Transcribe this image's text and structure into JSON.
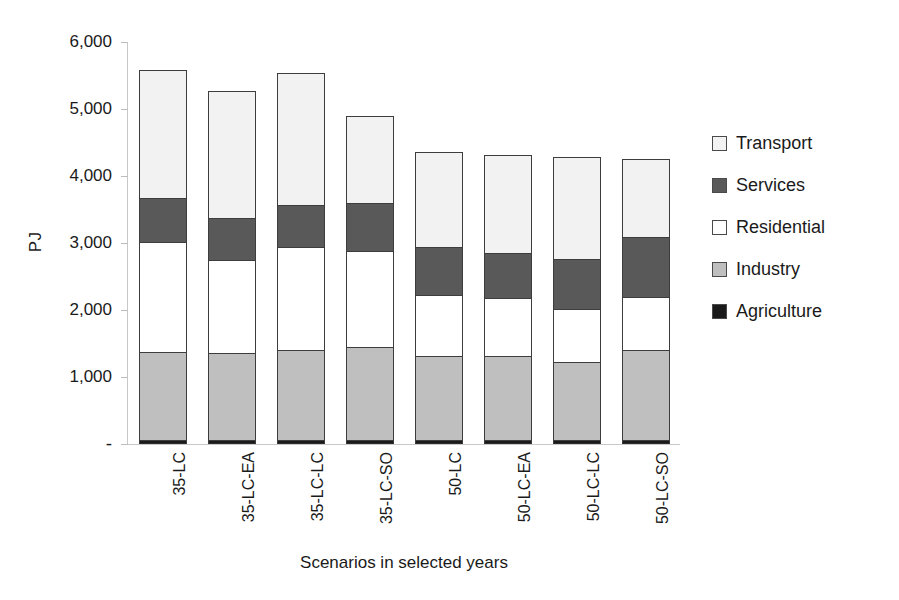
{
  "chart_data": {
    "type": "bar",
    "subtype": "stacked-bar",
    "title": "",
    "xlabel": "Scenarios in selected years",
    "ylabel": "PJ",
    "ylim": [
      0,
      6000
    ],
    "ytick_values": [
      0,
      1000,
      2000,
      3000,
      4000,
      5000,
      6000
    ],
    "ytick_labels": [
      "-",
      "1,000",
      "2,000",
      "3,000",
      "4,000",
      "5,000",
      "6,000"
    ],
    "grid": false,
    "legend_position": "right",
    "categories": [
      "35-LC",
      "35-LC-EA",
      "35-LC-LC",
      "35-LC-SO",
      "50-LC",
      "50-LC-EA",
      "50-LC-LC",
      "50-LC-SO"
    ],
    "series": [
      {
        "name": "Agriculture",
        "color": "#1a1a1a",
        "values": [
          60,
          60,
          60,
          60,
          55,
          55,
          55,
          55
        ]
      },
      {
        "name": "Industry",
        "color": "#bfbfbf",
        "values": [
          1320,
          1300,
          1345,
          1385,
          1260,
          1255,
          1165,
          1355
        ]
      },
      {
        "name": "Residential",
        "color": "#ffffff",
        "values": [
          1640,
          1390,
          1530,
          1440,
          905,
          870,
          800,
          790
        ]
      },
      {
        "name": "Services",
        "color": "#595959",
        "values": [
          655,
          625,
          630,
          715,
          720,
          670,
          745,
          895
        ]
      },
      {
        "name": "Transport",
        "color": "#f2f2f2",
        "values": [
          1910,
          1900,
          1975,
          1290,
          1425,
          1460,
          1525,
          1155
        ]
      }
    ],
    "totals": [
      5585,
      5275,
      5540,
      4890,
      4365,
      4310,
      4290,
      4250
    ],
    "stack_order_bottom_to_top": [
      "Agriculture",
      "Industry",
      "Residential",
      "Services",
      "Transport"
    ],
    "legend": [
      {
        "label": "Transport",
        "color": "#f2f2f2"
      },
      {
        "label": "Services",
        "color": "#595959"
      },
      {
        "label": "Residential",
        "color": "#ffffff"
      },
      {
        "label": "Industry",
        "color": "#bfbfbf"
      },
      {
        "label": "Agriculture",
        "color": "#1a1a1a"
      }
    ]
  }
}
